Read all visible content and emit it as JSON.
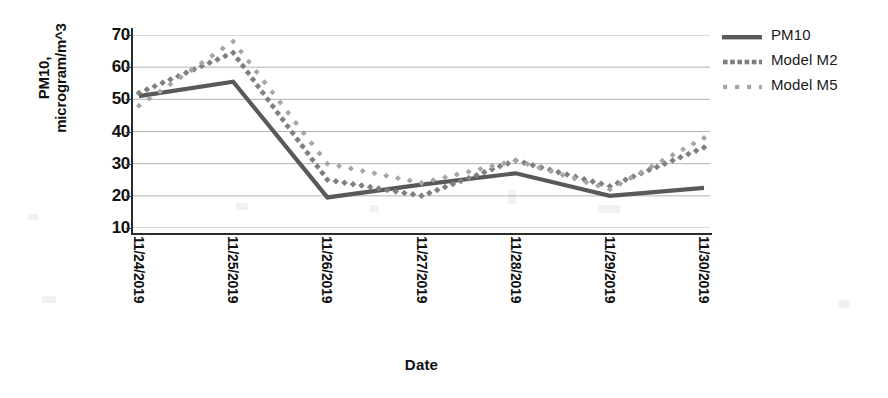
{
  "chart_data": {
    "type": "line",
    "title": "",
    "xlabel": "Date",
    "ylabel": "PM10, microgram/m^3",
    "ylabel_lines": [
      "PM10,",
      "microgram/m^3"
    ],
    "categories": [
      "11/24/2019",
      "11/25/2019",
      "11/26/2019",
      "11/27/2019",
      "11/28/2019",
      "11/29/2019",
      "11/30/2019"
    ],
    "yticks": [
      10,
      20,
      30,
      40,
      50,
      60,
      70
    ],
    "ylim": [
      6,
      72
    ],
    "grid": true,
    "legend_position": "right",
    "series": [
      {
        "name": "PM10",
        "style": "solid",
        "color": "#595959",
        "values": [
          51,
          55.5,
          19.5,
          23.5,
          27,
          20,
          22.5
        ]
      },
      {
        "name": "Model M2",
        "style": "dotted-dense",
        "color": "#7f7f7f",
        "values": [
          52,
          64.5,
          25,
          20,
          31,
          23,
          35
        ]
      },
      {
        "name": "Model M5",
        "style": "dotted-sparse",
        "color": "#a6a6a6",
        "values": [
          48,
          68,
          30,
          24,
          31,
          22,
          38
        ]
      }
    ]
  },
  "legend": {
    "items": [
      {
        "label": "PM10",
        "color": "#595959",
        "style": "solid"
      },
      {
        "label": "Model M2",
        "color": "#7f7f7f",
        "style": "dotted-dense"
      },
      {
        "label": "Model M5",
        "color": "#a6a6a6",
        "style": "dotted-sparse"
      }
    ]
  },
  "colors": {
    "axis": "#2b2b2b",
    "grid": "#b3b3b3",
    "text": "#111111",
    "background": "#ffffff"
  }
}
